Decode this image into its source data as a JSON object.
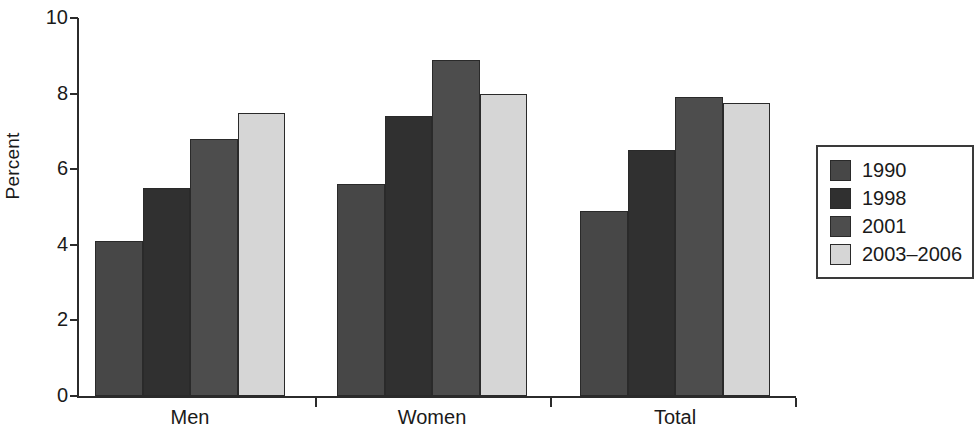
{
  "chart_data": {
    "type": "bar",
    "title": "",
    "xlabel": "",
    "ylabel": "Percent",
    "ylim": [
      0,
      10
    ],
    "yticks": [
      0,
      2,
      4,
      6,
      8,
      10
    ],
    "grid": false,
    "legend_position": "right",
    "categories": [
      "Men",
      "Women",
      "Total"
    ],
    "series": [
      {
        "name": "1990",
        "color": "#474747",
        "values": [
          4.1,
          5.6,
          4.9
        ]
      },
      {
        "name": "1998",
        "color": "#303030",
        "values": [
          5.5,
          7.4,
          6.5
        ]
      },
      {
        "name": "2001",
        "color": "#4d4d4d",
        "values": [
          6.8,
          8.9,
          7.9
        ]
      },
      {
        "name": "2003–2006",
        "color": "#d6d6d6",
        "values": [
          7.5,
          8.0,
          7.75
        ]
      }
    ]
  },
  "axis": {
    "y_label": "Percent",
    "y_tick_labels": [
      "10",
      "8",
      "6",
      "4",
      "2",
      "0"
    ],
    "x_tick_labels": [
      "Men",
      "Women",
      "Total"
    ]
  },
  "legend": {
    "items": [
      {
        "label": "1990",
        "color": "#474747"
      },
      {
        "label": "1998",
        "color": "#303030"
      },
      {
        "label": "2001",
        "color": "#4d4d4d"
      },
      {
        "label": "2003–2006",
        "color": "#d6d6d6"
      }
    ]
  }
}
